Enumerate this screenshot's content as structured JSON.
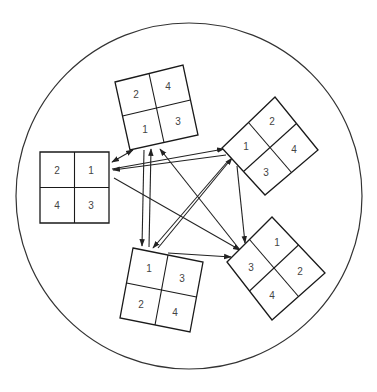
{
  "diagram": {
    "type": "state-transition",
    "circle": {
      "cx": 189,
      "cy": 196,
      "r": 173,
      "stroke": "#333333"
    },
    "nodes": [
      {
        "id": "top",
        "cells": [
          [
            "2",
            "4"
          ],
          [
            "1",
            "3"
          ]
        ],
        "corners": [
          [
            115,
            82
          ],
          [
            183,
            65
          ],
          [
            198,
            135
          ],
          [
            130,
            150
          ]
        ]
      },
      {
        "id": "left",
        "cells": [
          [
            "2",
            "1"
          ],
          [
            "4",
            "3"
          ]
        ],
        "corners": [
          [
            40,
            152
          ],
          [
            109,
            152
          ],
          [
            109,
            223
          ],
          [
            40,
            223
          ]
        ]
      },
      {
        "id": "right",
        "cells": [
          [
            "1",
            "2"
          ],
          [
            "3",
            "4"
          ]
        ],
        "corners": [
          [
            222,
            148
          ],
          [
            275,
            97
          ],
          [
            318,
            150
          ],
          [
            265,
            195
          ]
        ]
      },
      {
        "id": "bottom-right",
        "cells": [
          [
            "3",
            "1"
          ],
          [
            "4",
            "2"
          ]
        ],
        "corners": [
          [
            227,
            262
          ],
          [
            272,
            217
          ],
          [
            325,
            273
          ],
          [
            272,
            320
          ]
        ]
      },
      {
        "id": "bottom",
        "cells": [
          [
            "1",
            "3"
          ],
          [
            "2",
            "4"
          ]
        ],
        "corners": [
          [
            133,
            248
          ],
          [
            203,
            262
          ],
          [
            190,
            332
          ],
          [
            120,
            318
          ]
        ]
      }
    ],
    "edges": [
      {
        "from": "top",
        "to": "left",
        "bidirectional": true
      },
      {
        "from": "left",
        "to": "right"
      },
      {
        "from": "right",
        "to": "left"
      },
      {
        "from": "top",
        "to": "bottom"
      },
      {
        "from": "bottom",
        "to": "top"
      },
      {
        "from": "bottom",
        "to": "right"
      },
      {
        "from": "right",
        "to": "bottom"
      },
      {
        "from": "bottom-right",
        "to": "top"
      },
      {
        "from": "left",
        "to": "bottom-right"
      },
      {
        "from": "right",
        "to": "bottom-right"
      },
      {
        "from": "bottom",
        "to": "bottom-right"
      }
    ]
  },
  "labels": {
    "top": {
      "tl": "2",
      "tr": "4",
      "bl": "1",
      "br": "3"
    },
    "left": {
      "tl": "2",
      "tr": "1",
      "bl": "4",
      "br": "3"
    },
    "right": {
      "l": "1",
      "t": "2",
      "b": "3",
      "r": "4"
    },
    "bottom_right": {
      "l": "3",
      "t": "1",
      "b": "4",
      "r": "2"
    },
    "bottom": {
      "tl": "1",
      "tr": "3",
      "bl": "2",
      "br": "4"
    }
  }
}
